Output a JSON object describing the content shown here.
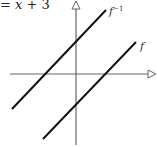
{
  "equation": {
    "prefix": "= ",
    "variable": "x",
    "rest": " + 3"
  },
  "diagram": {
    "type": "function-and-inverse-graph",
    "axes": {
      "x_arrow": true,
      "y_arrow": true
    },
    "lines": [
      {
        "label": "f",
        "description": "line below identity, y = x - 3"
      },
      {
        "label": "f",
        "superscript": "−1",
        "description": "inverse line, y = x + 3"
      }
    ],
    "colors": {
      "line": "#111111",
      "axis": "#666666"
    }
  }
}
